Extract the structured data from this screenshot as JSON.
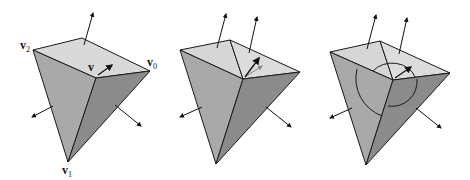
{
  "figure": {
    "panels": [
      {
        "id": "panel-1",
        "labels": {
          "v2": {
            "base": "v",
            "sub": "2"
          },
          "v0": {
            "base": "v",
            "sub": "0"
          },
          "v1": {
            "base": "v",
            "sub": "1"
          },
          "v": {
            "base": "v",
            "sub": ""
          }
        },
        "description": "Vertex v shared by three faces with per-face normals; single vertex normal arrow"
      },
      {
        "id": "panel-2",
        "description": "Top face split into two triangles; two top normals; vertex normal shown as averaged arrow with ghost arrow"
      },
      {
        "id": "panel-3",
        "description": "Face normals weighted by angle; arcs indicate incident angles at vertex"
      }
    ],
    "colors": {
      "top_face": "#d8d8d8",
      "left_face": "#a8a8a8",
      "right_face": "#8a8a8a",
      "edge": "#1a1a1a",
      "background": "#ffffff"
    }
  }
}
